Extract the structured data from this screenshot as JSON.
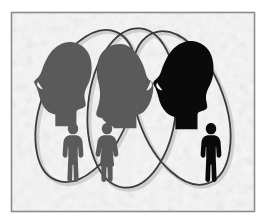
{
  "illustration": {
    "title": "Three overlapping groups Venn illustration",
    "canvas": {
      "width": 266,
      "height": 224
    },
    "background_color": "#ffffff",
    "frame": {
      "name": "picture-frame-border",
      "x": 11,
      "y": 12,
      "width": 244,
      "height": 200,
      "stroke_color": "#8c8c8c",
      "stroke_width": 1.6,
      "fill_color": "#f2f2f2"
    },
    "texture": {
      "name": "mottled-paper-texture",
      "base_color": "#f1f1f1",
      "speckle_light": "#fbfbfb",
      "speckle_dark": "#d8d8d8",
      "description": "grainy marbled off-white paper grain"
    },
    "colors": {
      "gray_silhouette": "#5a5a5a",
      "gray_silhouette_light": "#6a6a6a",
      "black_silhouette": "#0a0a0a",
      "ellipse_stroke": "#3a3a3a",
      "ellipse_shadow": "#b4b4b4",
      "frame_stroke": "#8c8c8c"
    },
    "ellipses": [
      {
        "name": "ellipse-left-group",
        "label": "Group 1",
        "cx": 86,
        "cy": 106,
        "rx": 44,
        "ry": 80,
        "rotation_deg": 22,
        "stroke_color": "#3a3a3a",
        "stroke_width": 1.8
      },
      {
        "name": "ellipse-middle-group",
        "label": "Group 2",
        "cx": 132,
        "cy": 108,
        "rx": 44,
        "ry": 80,
        "rotation_deg": 6,
        "stroke_color": "#3a3a3a",
        "stroke_width": 1.8
      },
      {
        "name": "ellipse-right-group",
        "label": "Group 3",
        "cx": 181,
        "cy": 108,
        "rx": 44,
        "ry": 80,
        "rotation_deg": -20,
        "stroke_color": "#3a3a3a",
        "stroke_width": 1.8
      }
    ],
    "head_silhouettes": [
      {
        "name": "head-profile-left",
        "description": "man facing left, gray",
        "color": "#5a5a5a",
        "x": 31,
        "y": 40,
        "scale": 1.0,
        "facing": "left",
        "hair": "short"
      },
      {
        "name": "head-profile-middle",
        "description": "woman facing right, gray",
        "color": "#5a5a5a",
        "x": 94,
        "y": 42,
        "scale": 1.0,
        "facing": "right",
        "hair": "bobbed"
      },
      {
        "name": "head-profile-right",
        "description": "man facing left, black",
        "color": "#0a0a0a",
        "x": 152,
        "y": 40,
        "scale": 1.05,
        "facing": "left",
        "hair": "short"
      }
    ],
    "person_figures": [
      {
        "name": "figure-person-male-left",
        "description": "standing male pictogram, gray",
        "color": "#5a5a5a",
        "x": 62,
        "y": 122,
        "scale": 1.0,
        "gender": "male"
      },
      {
        "name": "figure-person-female-middle",
        "description": "standing female pictogram in dress, gray",
        "color": "#5a5a5a",
        "x": 96,
        "y": 122,
        "scale": 1.0,
        "gender": "female"
      },
      {
        "name": "figure-person-male-right",
        "description": "standing male pictogram, black",
        "color": "#0a0a0a",
        "x": 200,
        "y": 122,
        "scale": 1.0,
        "gender": "male"
      }
    ]
  }
}
